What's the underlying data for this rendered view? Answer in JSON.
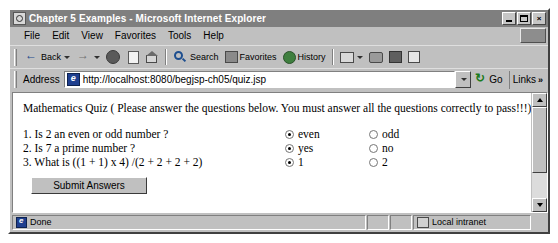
{
  "window": {
    "title": "Chapter 5 Examples - Microsoft Internet Explorer",
    "minimize_label": "",
    "maximize_label": "",
    "close_label": "×"
  },
  "menubar": {
    "items": [
      {
        "label": "File"
      },
      {
        "label": "Edit"
      },
      {
        "label": "View"
      },
      {
        "label": "Favorites"
      },
      {
        "label": "Tools"
      },
      {
        "label": "Help"
      }
    ]
  },
  "toolbar": {
    "back_label": "Back",
    "forward_label": "",
    "search_label": "Search",
    "favorites_label": "Favorites",
    "history_label": "History"
  },
  "address": {
    "label": "Address",
    "url": "http://localhost:8080/begjsp-ch05/quiz.jsp",
    "go_label": "Go",
    "links_label": "Links",
    "links_chevron": "»"
  },
  "page": {
    "heading": "Mathematics Quiz ( Please answer the questions below. You must answer all the questions correctly to pass!!!)",
    "questions": [
      {
        "text": "1. Is 2 an even or odd number ?",
        "options": [
          {
            "label": "even",
            "checked": true
          },
          {
            "label": "odd",
            "checked": false
          }
        ]
      },
      {
        "text": "2. Is 7 a prime number ?",
        "options": [
          {
            "label": "yes",
            "checked": true
          },
          {
            "label": "no",
            "checked": false
          }
        ]
      },
      {
        "text": "3. What is ((1 + 1) x 4) /(2 + 2 + 2 + 2)",
        "options": [
          {
            "label": "1",
            "checked": true
          },
          {
            "label": "2",
            "checked": false
          }
        ]
      }
    ],
    "submit_label": "Submit Answers"
  },
  "statusbar": {
    "status": "Done",
    "zone": "Local intranet"
  }
}
